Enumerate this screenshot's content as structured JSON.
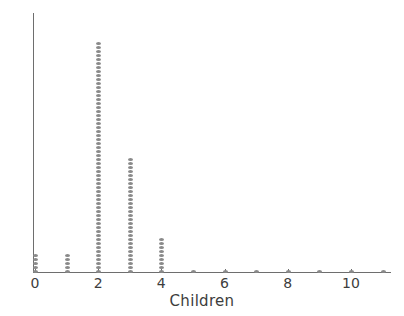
{
  "chart_data": {
    "type": "scatter",
    "plot_style": "dot-plot",
    "title": "",
    "subtitle": "",
    "xlabel": "Children",
    "ylabel": "",
    "categories": [
      0,
      1,
      2,
      3,
      4,
      5,
      6,
      7,
      8,
      9,
      10,
      11
    ],
    "values": [
      5,
      5,
      58,
      29,
      9,
      1,
      1,
      1,
      1,
      1,
      1,
      1
    ],
    "series": [
      {
        "name": "Count of households",
        "values": [
          5,
          5,
          58,
          29,
          9,
          1,
          1,
          1,
          1,
          1,
          1,
          1
        ]
      }
    ],
    "xtick_labels": [
      "0",
      "2",
      "4",
      "6",
      "8",
      "10"
    ],
    "xtick_values": [
      0,
      2,
      4,
      6,
      8,
      10
    ],
    "ytick_labels": [],
    "xlim": [
      0,
      11.2
    ],
    "ylim": [
      0,
      65
    ],
    "grid": false,
    "legend": null,
    "legend_position": "none",
    "annotations": [],
    "dot_color": "#8a8a8a",
    "axis_color": "#6e6e6e",
    "text_color": "#3d3d3d",
    "background_color": "#ffffff"
  },
  "axes": {
    "x_label": "Children",
    "ticks": [
      {
        "label": "0",
        "value": 0
      },
      {
        "label": "2",
        "value": 2
      },
      {
        "label": "4",
        "value": 4
      },
      {
        "label": "6",
        "value": 6
      },
      {
        "label": "8",
        "value": 8
      },
      {
        "label": "10",
        "value": 10
      }
    ]
  }
}
